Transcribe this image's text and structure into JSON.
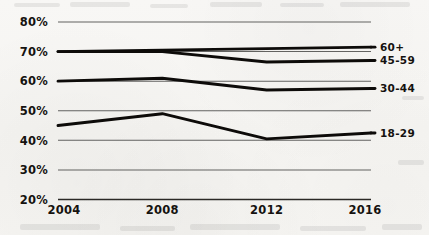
{
  "chart_data": {
    "type": "line",
    "title": "",
    "subtitle": "",
    "xlabel": "",
    "ylabel": "",
    "x": [
      2004,
      2008,
      2012,
      2016
    ],
    "categories": [
      "2004",
      "2008",
      "2012",
      "2016"
    ],
    "xtick_labels": [
      "2004",
      "2008",
      "2012",
      "2016"
    ],
    "ytick_labels": [
      "80%",
      "70%",
      "60%",
      "50%",
      "40%",
      "30%",
      "20%"
    ],
    "ytick_values": [
      80,
      70,
      60,
      50,
      40,
      30,
      20
    ],
    "ylim": [
      20,
      80
    ],
    "xlim": [
      2004,
      2016
    ],
    "grid": true,
    "grid_axis": "y",
    "legend_position": "right-inline",
    "series": [
      {
        "name": "60+",
        "label": "60+",
        "values": [
          70,
          70.5,
          71,
          71.5
        ],
        "color": "#0d0b09"
      },
      {
        "name": "45-59",
        "label": "45-59",
        "values": [
          70,
          70,
          66.5,
          67
        ],
        "color": "#0d0b09"
      },
      {
        "name": "30-44",
        "label": "30-44",
        "values": [
          60,
          61,
          57,
          57.5
        ],
        "color": "#0d0b09"
      },
      {
        "name": "18-29",
        "label": "18-29",
        "values": [
          45,
          49,
          40.5,
          42.5
        ],
        "color": "#0d0b09"
      }
    ]
  },
  "legend": {
    "items": [
      {
        "label": "60+"
      },
      {
        "label": "45-59"
      },
      {
        "label": "30-44"
      },
      {
        "label": "18-29"
      }
    ]
  },
  "colors": {
    "background": "#f7f6f4",
    "ink": "#0d0b09",
    "grid": "#4a4a48"
  }
}
